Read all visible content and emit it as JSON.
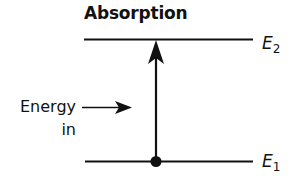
{
  "diagram": {
    "title": "Absorption",
    "levels": [
      {
        "name": "upper-level",
        "symbol": "E",
        "subscript": "2"
      },
      {
        "name": "lower-level",
        "symbol": "E",
        "subscript": "1"
      }
    ],
    "energy_label": {
      "line1": "Energy",
      "line2": "in"
    },
    "transition": "upward arrow from E1 to E2",
    "colors": {
      "stroke": "#111111",
      "background": "#ffffff"
    }
  }
}
